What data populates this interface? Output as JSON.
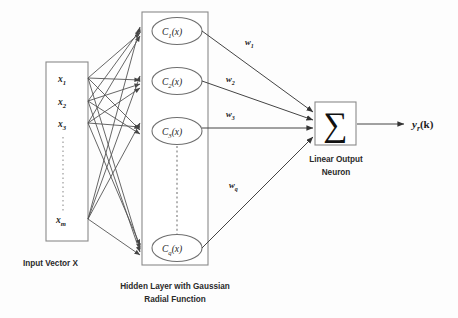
{
  "diagram": {
    "background_color": "#fdfdfd",
    "stroke_color": "#555555"
  },
  "input_layer": {
    "caption": "Input Vector X",
    "nodes": [
      {
        "label": "x",
        "sub": "1"
      },
      {
        "label": "x",
        "sub": "2"
      },
      {
        "label": "x",
        "sub": "3"
      },
      {
        "label": "x",
        "sub": "m"
      }
    ],
    "ellipsis": "vertical-dots"
  },
  "hidden_layer": {
    "caption_line1": "Hidden Layer with Gaussian",
    "caption_line2": "Radial Function",
    "nodes": [
      {
        "label": "C",
        "sub": "1",
        "arg": "(x)"
      },
      {
        "label": "C",
        "sub": "2",
        "arg": "(x)"
      },
      {
        "label": "C",
        "sub": "3",
        "arg": "(x)"
      },
      {
        "label": "C",
        "sub": "q",
        "arg": "(x)"
      }
    ],
    "ellipsis": "vertical-dashes"
  },
  "weights": [
    {
      "label": "w",
      "sub": "1"
    },
    {
      "label": "w",
      "sub": "2"
    },
    {
      "label": "w",
      "sub": "3"
    },
    {
      "label": "w",
      "sub": "q"
    }
  ],
  "output_neuron": {
    "symbol": "∑",
    "caption_line1": "Linear Output",
    "caption_line2": "Neuron",
    "output_label": "y",
    "output_sub": "r",
    "output_arg": "(k)"
  }
}
